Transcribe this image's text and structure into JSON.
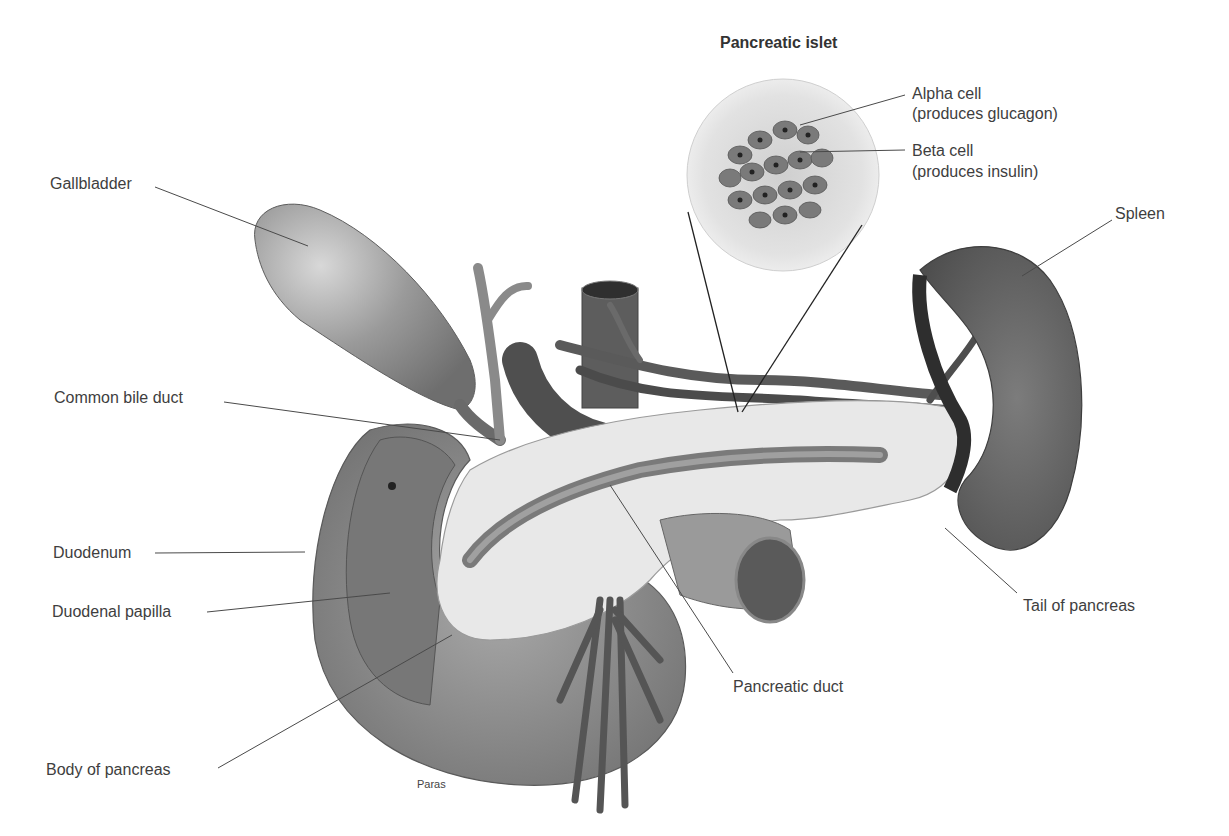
{
  "diagram": {
    "inset_title": "Pancreatic islet",
    "labels": {
      "gallbladder": "Gallbladder",
      "common_bile_duct": "Common bile duct",
      "duodenum": "Duodenum",
      "duodenal_papilla": "Duodenal papilla",
      "body_of_pancreas": "Body of pancreas",
      "pancreatic_duct": "Pancreatic duct",
      "tail_of_pancreas": "Tail of pancreas",
      "spleen": "Spleen",
      "alpha_cell": "Alpha cell",
      "alpha_cell_note": "(produces glucagon)",
      "beta_cell": "Beta cell",
      "beta_cell_note": "(produces insulin)"
    },
    "artist_credit": "Paras",
    "colors": {
      "organ_dark": "#6a6a6a",
      "organ_mid": "#8d8d8d",
      "pancreas_light": "#e6e6e6",
      "leader_line": "#4a4a4a",
      "text": "#3e3e3e"
    }
  }
}
